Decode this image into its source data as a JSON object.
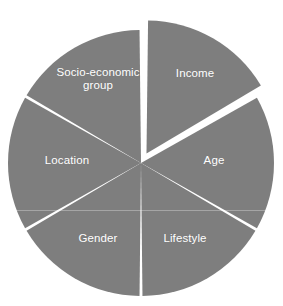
{
  "chart_data": {
    "type": "pie",
    "title": "",
    "subtitle": "",
    "xlabel": "",
    "ylabel": "",
    "legend": "none",
    "grid": false,
    "slice_fill_color": "#7e7e7e",
    "separator_color": "#ffffff",
    "label_color": "#ffffff",
    "background_color": "#ffffff",
    "exploded_slice": "Income",
    "categories": [
      "Income",
      "Age",
      "Lifestyle",
      "Gender",
      "Location",
      "Socio-economic group"
    ],
    "values": [
      16.667,
      16.667,
      16.667,
      16.667,
      16.667,
      16.667
    ],
    "slices": [
      {
        "label": "Income",
        "value": 16.667,
        "start_angle": 0,
        "end_angle": 60,
        "exploded": true,
        "label_x": 195,
        "label_y": 73,
        "label_text": "Income"
      },
      {
        "label": "Age",
        "value": 16.667,
        "start_angle": 60,
        "end_angle": 120,
        "exploded": false,
        "label_x": 214,
        "label_y": 160,
        "label_text": "Age"
      },
      {
        "label": "Lifestyle",
        "value": 16.667,
        "start_angle": 120,
        "end_angle": 180,
        "exploded": false,
        "label_x": 185,
        "label_y": 238,
        "label_text": "Lifestyle"
      },
      {
        "label": "Gender",
        "value": 16.667,
        "start_angle": 180,
        "end_angle": 240,
        "exploded": false,
        "label_x": 98,
        "label_y": 238,
        "label_text": "Gender"
      },
      {
        "label": "Location",
        "value": 16.667,
        "start_angle": 240,
        "end_angle": 300,
        "exploded": false,
        "label_x": 67,
        "label_y": 160,
        "label_text": "Location"
      },
      {
        "label": "Socio-economic group",
        "value": 16.667,
        "start_angle": 300,
        "end_angle": 360,
        "exploded": false,
        "label_x": 98,
        "label_y": 79,
        "label_text": "Socio-economic\ngroup"
      }
    ]
  },
  "geometry": {
    "center_x": 141,
    "center_y": 163,
    "radius": 133,
    "explode_offset": 11,
    "gap_width": 3.5
  }
}
